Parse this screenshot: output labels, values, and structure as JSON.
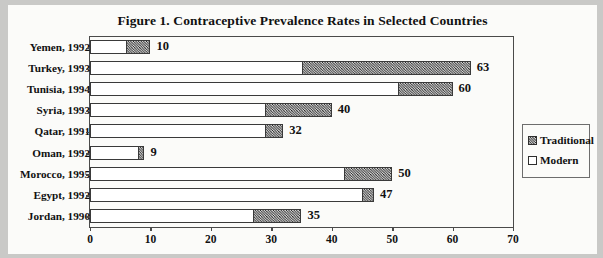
{
  "chart_data": {
    "type": "bar",
    "orientation": "horizontal",
    "stacked": true,
    "title": "Figure 1. Contraceptive Prevalence Rates in Selected Countries",
    "xlabel": "",
    "ylabel": "",
    "xlim": [
      0,
      70
    ],
    "xticks": [
      0,
      10,
      20,
      30,
      40,
      50,
      60,
      70
    ],
    "grid": false,
    "legend_position": "right",
    "categories": [
      "Yemen, 1992",
      "Turkey, 1993",
      "Tunisia, 1994",
      "Syria, 1993",
      "Qatar, 1991",
      "Oman, 1992",
      "Morocco, 1995",
      "Egypt, 1992",
      "Jordan, 1990"
    ],
    "series": [
      {
        "name": "Modern",
        "color": "#ffffff",
        "values": [
          6,
          35,
          51,
          29,
          29,
          8,
          42,
          45,
          27
        ]
      },
      {
        "name": "Traditional",
        "color": "#7a7a7a",
        "values": [
          4,
          28,
          9,
          11,
          3,
          1,
          8,
          2,
          8
        ]
      }
    ],
    "totals": [
      10,
      63,
      60,
      40,
      32,
      9,
      50,
      47,
      35
    ],
    "total_labels": [
      "10",
      "63",
      "60",
      "40",
      "32",
      "9",
      "50",
      "47",
      "35"
    ],
    "tick_labels": [
      "0",
      "10",
      "20",
      "30",
      "40",
      "50",
      "60",
      "70"
    ]
  },
  "legend": {
    "items": [
      {
        "label": "Traditional",
        "swatch": "hatched"
      },
      {
        "label": "Modern",
        "swatch": "white"
      }
    ]
  }
}
